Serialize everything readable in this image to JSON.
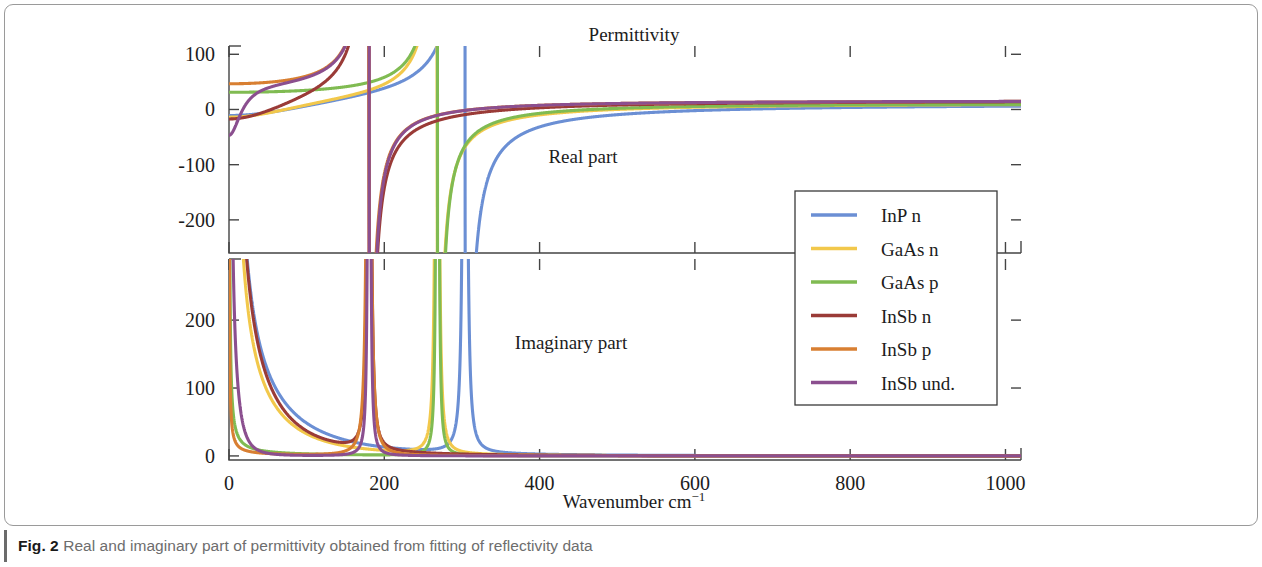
{
  "figure": {
    "caption_label": "Fig. 2",
    "caption_text": "Real and imaginary part of permittivity obtained from fitting of reflectivity data"
  },
  "chart_data": {
    "type": "line",
    "title": "Permittivity",
    "xlabel": "Wavenumber cm⁻¹",
    "ylabel": "",
    "xlim": [
      0,
      1020
    ],
    "xticks": [
      0,
      200,
      400,
      600,
      800,
      1000
    ],
    "xtick_labels": [
      "0",
      "200",
      "400",
      "600",
      "800",
      "1000"
    ],
    "xminor": [
      100,
      300,
      500,
      700,
      900
    ],
    "grid": false,
    "legend_position": "center-right",
    "panels": [
      {
        "name": "real",
        "annotation": "Real part",
        "ylim": [
          -260,
          115
        ],
        "yticks": [
          -200,
          -100,
          0,
          100
        ],
        "ytick_labels": [
          "-200",
          "-100",
          "0",
          "100"
        ],
        "ylabel": "Real part"
      },
      {
        "name": "imaginary",
        "annotation": "Imaginary part",
        "ylim": [
          -6,
          290
        ],
        "yticks": [
          0,
          100,
          200
        ],
        "ytick_labels": [
          "0",
          "100",
          "200"
        ],
        "ylabel": "Imaginary part"
      }
    ],
    "series": [
      {
        "name": "InP n",
        "color": "#6b8fd4",
        "eps_inf": 9.6,
        "wTO": 304.0,
        "gTO": 3.0,
        "S": 2.7,
        "wp": 330.0,
        "gp": 150.0
      },
      {
        "name": "GaAs n",
        "color": "#f2c84b",
        "eps_inf": 11.0,
        "wTO": 268.0,
        "gTO": 3.2,
        "S": 1.9,
        "wp": 245.0,
        "gp": 120.0
      },
      {
        "name": "GaAs p",
        "color": "#80bb52",
        "eps_inf": 11.0,
        "wTO": 268.5,
        "gTO": 1.6,
        "S": 1.95,
        "wp": 90.0,
        "gp": 260.0
      },
      {
        "name": "InSb n",
        "color": "#9a3b37",
        "eps_inf": 15.7,
        "wTO": 180.5,
        "gTO": 3.0,
        "S": 2.1,
        "wp": 215.0,
        "gp": 105.0
      },
      {
        "name": "InSb p",
        "color": "#d87f32",
        "eps_inf": 15.7,
        "wTO": 180.0,
        "gTO": 4.2,
        "S": 2.0,
        "wp": 60.0,
        "gp": 330.0
      },
      {
        "name": "InSb und.",
        "color": "#8b4f8f",
        "eps_inf": 15.7,
        "wTO": 180.5,
        "gTO": 1.5,
        "S": 2.0,
        "wp": 44.0,
        "gp": 18.0
      }
    ],
    "legend_entries": [
      "InP n",
      "GaAs n",
      "GaAs p",
      "InSb n",
      "InSb p",
      "InSb und."
    ],
    "annotations": [
      "Permittivity",
      "Real part",
      "Imaginary part"
    ]
  }
}
